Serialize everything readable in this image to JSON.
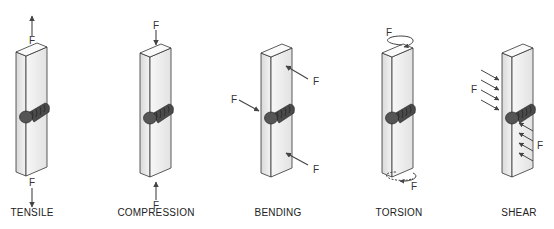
{
  "figure": {
    "panels": [
      {
        "id": "tensile",
        "label": "TENSILE",
        "force_label": "F",
        "force_count": 2,
        "description": "Forces pull apart along bar axis"
      },
      {
        "id": "compression",
        "label": "COMPRESSION",
        "force_label": "F",
        "force_count": 2,
        "description": "Forces push together along bar axis"
      },
      {
        "id": "bending",
        "label": "BENDING",
        "force_label": "F",
        "force_count": 3,
        "description": "Transverse forces bend the bar at the weld"
      },
      {
        "id": "torsion",
        "label": "TORSION",
        "force_label": "F",
        "force_count": 2,
        "description": "Opposing twisting moments at both ends"
      },
      {
        "id": "shear",
        "label": "SHEAR",
        "force_label": "F",
        "force_count": 2,
        "description": "Parallel opposing forces across the weld"
      }
    ]
  },
  "colors": {
    "bar_face": "#e8e8e8",
    "bar_side": "#f6f6f6",
    "weld": "#3a3a3a",
    "arrow": "#444444",
    "text": "#222222"
  }
}
